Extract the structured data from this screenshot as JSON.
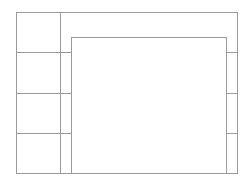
{
  "diagram": {
    "type": "wireframe-layout",
    "line_color": "#9a9a9a",
    "background": "#ffffff",
    "outer_frame": {
      "x": 16,
      "y": 12,
      "w": 222,
      "h": 162
    },
    "left_column": {
      "divider_x": 60,
      "rows": 4,
      "row_dividers_y": [
        52,
        93,
        133
      ]
    },
    "inner_panel": {
      "x": 71,
      "y": 37,
      "w": 155,
      "h": 137
    },
    "right_strip": {
      "x": 226,
      "rows": 3,
      "row_dividers_y": [
        52,
        93,
        133
      ]
    }
  }
}
